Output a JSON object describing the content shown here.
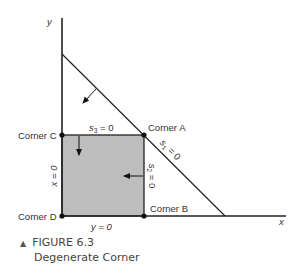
{
  "figure": {
    "number_label": "FIGURE 6.3",
    "title": "Degenerate Corner",
    "marker": "▲"
  },
  "axes": {
    "x_label": "x",
    "y_label": "y"
  },
  "corners": {
    "A": "Corner A",
    "B": "Corner B",
    "C": "Corner C",
    "D": "Corner D"
  },
  "constraints": {
    "s1": {
      "var": "s",
      "sub": "1",
      "eq": " = 0"
    },
    "s2": {
      "var": "s",
      "sub": "2",
      "eq": " = 0"
    },
    "s3": {
      "var": "s",
      "sub": "3",
      "eq": " = 0"
    },
    "x0": "x = 0",
    "y0": "y = 0"
  },
  "colors": {
    "feasible_region": "#bdbdbd",
    "lines": "#222222"
  }
}
